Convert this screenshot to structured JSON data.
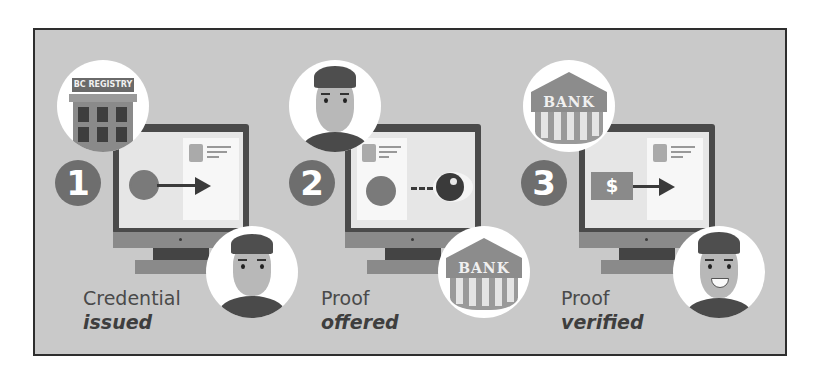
{
  "steps": [
    {
      "number": "1",
      "caption_line1": "Credential",
      "caption_line2": "issued",
      "top_icon": "registry-building",
      "top_icon_label": "BC REGISTRY",
      "screen_action": "seal-to-credential-arrow",
      "bottom_icon": "person"
    },
    {
      "number": "2",
      "caption_line1": "Proof",
      "caption_line2": "offered",
      "top_icon": "person",
      "screen_action": "seal-dotted-line-eye",
      "bottom_icon": "bank-building",
      "bottom_icon_label": "BANK"
    },
    {
      "number": "3",
      "caption_line1": "Proof",
      "caption_line2": "verified",
      "top_icon": "bank-building",
      "top_icon_label": "BANK",
      "screen_action": "money-to-credential-arrow",
      "money_symbol": "$",
      "bottom_icon": "person-smiling"
    }
  ],
  "colors": {
    "background": "#c9c9c9",
    "frame_border": "#2e2e2e",
    "badge": "#6e6e6e",
    "monitor_bezel": "#4a4a4a",
    "screen": "#e6e6e6",
    "caption_text": "#4a4a4a"
  }
}
